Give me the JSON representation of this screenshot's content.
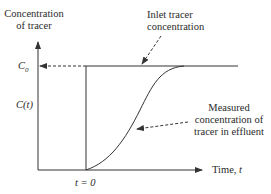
{
  "diagram": {
    "y_axis_label_line1": "Concentration",
    "y_axis_label_line2": "of tracer",
    "x_axis_label_prefix": "Time, ",
    "x_axis_label_var": "t",
    "c0_label_main": "C",
    "c0_label_sub": "0",
    "ct_label": "C(t)",
    "t0_label": "t = 0",
    "inlet_label_line1": "Inlet tracer",
    "inlet_label_line2": "concentration",
    "measured_label_line1": "Measured",
    "measured_label_line2": "concentration of",
    "measured_label_line3": "tracer in effluent",
    "colors": {
      "line": "#333333",
      "background": "#ffffff"
    }
  }
}
